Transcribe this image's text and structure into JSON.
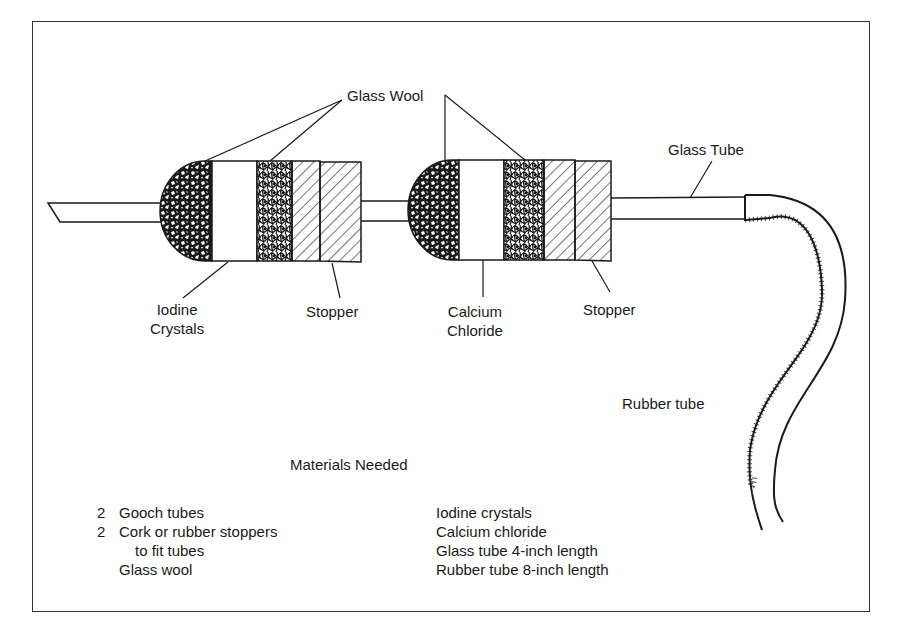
{
  "diagram": {
    "labels": {
      "glass_wool": "Glass Wool",
      "glass_tube": "Glass Tube",
      "iodine_crystals": [
        "Iodine",
        "Crystals"
      ],
      "stopper_1": "Stopper",
      "calcium_chloride": [
        "Calcium",
        "Chloride"
      ],
      "stopper_2": "Stopper",
      "rubber_tube": "Rubber tube"
    },
    "colors": {
      "ink": "#1a1a1a",
      "background": "#ffffff"
    }
  },
  "materials": {
    "title": "Materials Needed",
    "left": [
      {
        "qty": "2",
        "text": "Gooch tubes"
      },
      {
        "qty": "2",
        "text": "Cork or rubber stoppers"
      },
      {
        "qty": "",
        "text": "to fit tubes",
        "indent": true
      },
      {
        "qty": "",
        "text": "Glass wool"
      }
    ],
    "right": [
      "Iodine crystals",
      "Calcium chloride",
      "Glass tube 4-inch length",
      "Rubber tube 8-inch length"
    ]
  }
}
